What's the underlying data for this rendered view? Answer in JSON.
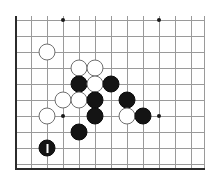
{
  "board": {
    "title": "Go board position diagram",
    "board_size_label": "19x19",
    "visible_columns": 12,
    "visible_rows": 10,
    "origin_x": 15,
    "origin_y": 20,
    "cell": 16,
    "stone_diameter": 17,
    "colors": {
      "background": "#ffffff",
      "grid_line": "#9a9a9a",
      "edge_line": "#2b2b2b",
      "black_stone": "#141414",
      "white_stone": "#ffffff",
      "white_stone_outline": "#6f6f6f",
      "star_point": "#1a1a1a",
      "move_mark": "#ffffff"
    },
    "edges": [
      {
        "name": "left-edge",
        "orientation": "v",
        "x": 15,
        "y": 16,
        "length": 153
      },
      {
        "name": "bottom-edge",
        "orientation": "h",
        "x": 15,
        "y": 168,
        "length": 190
      }
    ],
    "h_lines_y": [
      20,
      36,
      52,
      68,
      84,
      100,
      116,
      132,
      148,
      164
    ],
    "v_lines_x": [
      31,
      47,
      63,
      79,
      95,
      111,
      127,
      143,
      159,
      175,
      191,
      204
    ],
    "star_points": [
      {
        "name": "star-point-top-left",
        "x": 63,
        "y": 20
      },
      {
        "name": "star-point-top-right",
        "x": 159,
        "y": 20
      },
      {
        "name": "star-point-center-left",
        "x": 63,
        "y": 116
      },
      {
        "name": "star-point-center-right",
        "x": 159,
        "y": 116
      }
    ],
    "stones": [
      {
        "name": "stone-white-1",
        "color": "white",
        "x": 47,
        "y": 52,
        "marked": false
      },
      {
        "name": "stone-white-2",
        "color": "white",
        "x": 79,
        "y": 68,
        "marked": false
      },
      {
        "name": "stone-white-3",
        "color": "white",
        "x": 95,
        "y": 68,
        "marked": false
      },
      {
        "name": "stone-black-1",
        "color": "black",
        "x": 79,
        "y": 84,
        "marked": false
      },
      {
        "name": "stone-white-4",
        "color": "white",
        "x": 95,
        "y": 84,
        "marked": false
      },
      {
        "name": "stone-black-2",
        "color": "black",
        "x": 111,
        "y": 84,
        "marked": false
      },
      {
        "name": "stone-white-5",
        "color": "white",
        "x": 63,
        "y": 100,
        "marked": false
      },
      {
        "name": "stone-white-6",
        "color": "white",
        "x": 79,
        "y": 100,
        "marked": false
      },
      {
        "name": "stone-black-3",
        "color": "black",
        "x": 95,
        "y": 100,
        "marked": false
      },
      {
        "name": "stone-black-4",
        "color": "black",
        "x": 127,
        "y": 100,
        "marked": false
      },
      {
        "name": "stone-white-7",
        "color": "white",
        "x": 47,
        "y": 116,
        "marked": false
      },
      {
        "name": "stone-black-5",
        "color": "black",
        "x": 95,
        "y": 116,
        "marked": false
      },
      {
        "name": "stone-white-8",
        "color": "white",
        "x": 127,
        "y": 116,
        "marked": false
      },
      {
        "name": "stone-black-6",
        "color": "black",
        "x": 143,
        "y": 116,
        "marked": false
      },
      {
        "name": "stone-black-7",
        "color": "black",
        "x": 79,
        "y": 132,
        "marked": false
      },
      {
        "name": "stone-black-last-move",
        "color": "black",
        "x": 47,
        "y": 148,
        "marked": true
      }
    ]
  }
}
